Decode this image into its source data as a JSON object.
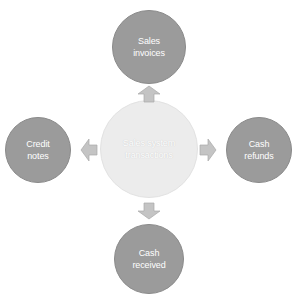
{
  "diagram": {
    "center": {
      "label": "Sales system\ntransactions",
      "color": "#ececec"
    },
    "nodes": [
      {
        "id": "top",
        "label": "Sales\ninvoices",
        "color": "#9b9b9b"
      },
      {
        "id": "left",
        "label": "Credit\nnotes",
        "color": "#9b9b9b"
      },
      {
        "id": "right",
        "label": "Cash\nrefunds",
        "color": "#9b9b9b"
      },
      {
        "id": "bottom",
        "label": "Cash\nreceived",
        "color": "#9b9b9b"
      }
    ],
    "arrow_color": "#c4c4c4"
  }
}
